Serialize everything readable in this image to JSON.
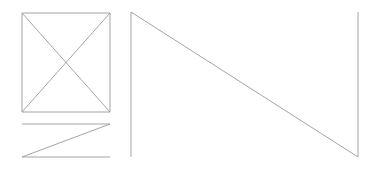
{
  "canvas": {
    "width": 383,
    "height": 173,
    "background_color": "#ffffff",
    "stroke_color": "#9a9a9a",
    "stroke_width": 0.9
  },
  "figures": [
    {
      "name": "placeholder-square-with-x",
      "description": "square with both diagonals forming an X",
      "bounds": {
        "x1": 22,
        "y1": 13,
        "x2": 110,
        "y2": 112
      },
      "segments": [
        {
          "name": "square-top-edge",
          "x1": 22,
          "y1": 13,
          "x2": 110,
          "y2": 13
        },
        {
          "name": "square-right-edge",
          "x1": 110,
          "y1": 13,
          "x2": 110,
          "y2": 112
        },
        {
          "name": "square-bottom-edge",
          "x1": 110,
          "y1": 112,
          "x2": 22,
          "y2": 112
        },
        {
          "name": "square-left-edge",
          "x1": 22,
          "y1": 112,
          "x2": 22,
          "y2": 13
        },
        {
          "name": "diagonal-tl-br",
          "x1": 22,
          "y1": 13,
          "x2": 110,
          "y2": 112
        },
        {
          "name": "diagonal-tr-bl",
          "x1": 110,
          "y1": 13,
          "x2": 22,
          "y2": 112
        }
      ]
    },
    {
      "name": "z-shape",
      "description": "two horizontal rules joined by a diagonal forming a Z",
      "bounds": {
        "x1": 22,
        "y1": 124,
        "x2": 110,
        "y2": 157
      },
      "segments": [
        {
          "name": "z-top-rule",
          "x1": 22,
          "y1": 124,
          "x2": 110,
          "y2": 124
        },
        {
          "name": "z-diagonal",
          "x1": 110,
          "y1": 124,
          "x2": 22,
          "y2": 157
        },
        {
          "name": "z-bottom-rule",
          "x1": 22,
          "y1": 157,
          "x2": 110,
          "y2": 157
        }
      ]
    },
    {
      "name": "n-shape",
      "description": "two tall verticals joined by a descending diagonal forming an N",
      "bounds": {
        "x1": 131,
        "y1": 12,
        "x2": 358,
        "y2": 157
      },
      "segments": [
        {
          "name": "n-left-vertical",
          "x1": 131,
          "y1": 12,
          "x2": 131,
          "y2": 157
        },
        {
          "name": "n-diagonal",
          "x1": 131,
          "y1": 12,
          "x2": 358,
          "y2": 157
        },
        {
          "name": "n-right-vertical",
          "x1": 358,
          "y1": 12,
          "x2": 358,
          "y2": 157
        }
      ]
    }
  ]
}
